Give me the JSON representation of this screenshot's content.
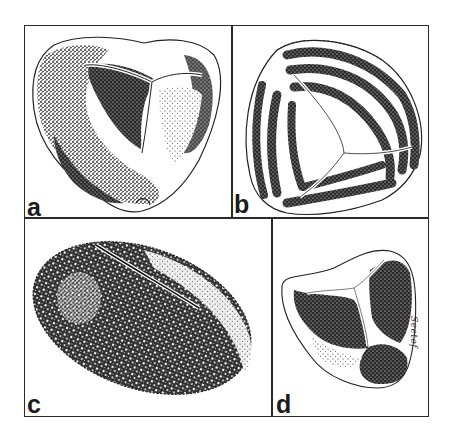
{
  "figure": {
    "panels": [
      {
        "id": "a",
        "label": "a",
        "subject": "trilete spore, oblique view, coarse stippled exine with Y-shaped laesura"
      },
      {
        "id": "b",
        "label": "b",
        "subject": "trilete spore with parallel ribs (cicatricose / striate ornamentation)"
      },
      {
        "id": "c",
        "label": "c",
        "subject": "monolete bean-shaped spore with verrucate stippled surface and single slit"
      },
      {
        "id": "d",
        "label": "d",
        "subject": "small trilete spore, triangular amb with three dark concave faces"
      }
    ],
    "signature": "Seetef"
  },
  "colors": {
    "ink": "#1c1c1c",
    "border": "#2a2a2a",
    "paper": "#ffffff"
  }
}
